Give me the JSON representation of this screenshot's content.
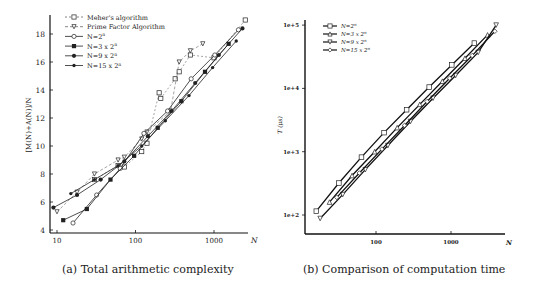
{
  "captions": {
    "a": "(a) Total arithmetic complexity",
    "b": "(b) Comparison of computation time"
  },
  "chart_data": [
    {
      "type": "line",
      "title": "(a) Total arithmetic complexity",
      "xlabel": "N",
      "ylabel": "[M(N)+A(N)]/N",
      "xscale": "log",
      "xlim": [
        9,
        2800
      ],
      "ylim": [
        4,
        19.5
      ],
      "xticks": [
        10,
        100,
        1000
      ],
      "xtick_labels": [
        "10",
        "100",
        "1000"
      ],
      "yticks": [
        4,
        6,
        8,
        10,
        12,
        14,
        16,
        18
      ],
      "ytick_labels": [
        "4",
        "6",
        "8",
        "10",
        "12",
        "14",
        "16",
        "18"
      ],
      "legend_position": "upper left",
      "grid": false,
      "series": [
        {
          "name": "Meher's algorithm",
          "marker": "square-open",
          "dash": "2,2",
          "x": [
            30,
            60,
            72,
            120,
            140,
            200,
            210,
            320,
            360,
            500,
            1000,
            2500
          ],
          "y": [
            7.6,
            8.6,
            8.5,
            9.6,
            10.2,
            13.8,
            13.4,
            14.8,
            15.3,
            16.5,
            16.3,
            19.0
          ]
        },
        {
          "name": "Prime Factor Algorithm",
          "marker": "triangle-down-open",
          "dash": "3,2",
          "x": [
            10,
            18,
            30,
            60,
            72,
            120,
            140,
            280,
            360,
            500,
            720
          ],
          "y": [
            5.3,
            6.7,
            8.0,
            9.0,
            9.2,
            10.5,
            11.0,
            12.5,
            16.0,
            16.8,
            17.3
          ]
        },
        {
          "name": "N=2^n",
          "marker": "circle-open",
          "dash": "",
          "x": [
            16,
            32,
            64,
            128,
            256,
            512,
            1024,
            2048
          ],
          "y": [
            4.5,
            6.5,
            8.4,
            10.9,
            12.5,
            14.8,
            16.5,
            18.3
          ]
        },
        {
          "name": "N=3 x 2^n",
          "marker": "square-filled",
          "dash": "",
          "x": [
            12,
            24,
            48,
            96,
            192,
            384,
            768,
            1536
          ],
          "y": [
            4.7,
            5.5,
            7.6,
            9.3,
            11.3,
            13.2,
            15.3,
            17.3
          ]
        },
        {
          "name": "N=9 x 2^n",
          "marker": "circle-filled",
          "dash": "",
          "x": [
            9,
            18,
            36,
            72,
            144,
            288,
            576,
            1152,
            2304
          ],
          "y": [
            5.6,
            6.5,
            7.6,
            8.9,
            10.7,
            12.5,
            14.5,
            16.5,
            18.4
          ]
        },
        {
          "name": "N=15 x 2^n",
          "marker": "dot-filled",
          "dash": "",
          "x": [
            15,
            30,
            60,
            120,
            240,
            480,
            960,
            1920
          ],
          "y": [
            6.6,
            7.6,
            8.6,
            10.0,
            11.8,
            13.6,
            15.6,
            17.5
          ]
        }
      ]
    },
    {
      "type": "line",
      "title": "(b) Comparison of computation time",
      "xlabel": "N",
      "ylabel": "T (μs)",
      "xscale": "log",
      "yscale": "log",
      "xlim": [
        13,
        4000
      ],
      "ylim": [
        50,
        120000
      ],
      "xticks": [
        100,
        1000
      ],
      "xtick_labels": [
        "100",
        "1000"
      ],
      "yticks": [
        100,
        1000,
        10000,
        100000
      ],
      "ytick_labels": [
        "1e+2",
        "1e+3",
        "1e+4",
        "1e+5"
      ],
      "legend_position": "upper left",
      "grid": false,
      "series": [
        {
          "name": "N=2^n",
          "marker": "square-open",
          "x": [
            16,
            32,
            64,
            128,
            256,
            512,
            1024,
            2048
          ],
          "y": [
            115,
            320,
            820,
            2000,
            4600,
            10500,
            23500,
            52000
          ]
        },
        {
          "name": "N=3 x 2^n",
          "marker": "triangle-up-open",
          "x": [
            24,
            48,
            96,
            192,
            384,
            768,
            1536,
            3072
          ],
          "y": [
            160,
            420,
            1000,
            2400,
            5600,
            13000,
            30000,
            70000
          ]
        },
        {
          "name": "N=9 x 2^n",
          "marker": "triangle-down-open",
          "x": [
            18,
            36,
            72,
            144,
            288,
            576,
            1152,
            2304,
            4000
          ],
          "y": [
            88,
            210,
            520,
            1250,
            3000,
            7000,
            16000,
            37000,
            100000
          ]
        },
        {
          "name": "N=15 x 2^n",
          "marker": "diamond-open",
          "x": [
            30,
            60,
            120,
            240,
            480,
            960,
            1920,
            3840
          ],
          "y": [
            190,
            460,
            1100,
            2600,
            6200,
            14500,
            33000,
            80000
          ]
        }
      ]
    }
  ]
}
